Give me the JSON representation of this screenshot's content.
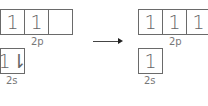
{
  "before": {
    "p_orbitals": [
      "1",
      "1",
      ""
    ],
    "p_label": "2p",
    "s_orbital": "1⇂",
    "s_label": "2s"
  },
  "after": {
    "p_orbitals": [
      "1",
      "1",
      "1"
    ],
    "p_label": "2p",
    "s_orbital": "1",
    "s_label": "2s"
  },
  "arrow": "right-arrow"
}
